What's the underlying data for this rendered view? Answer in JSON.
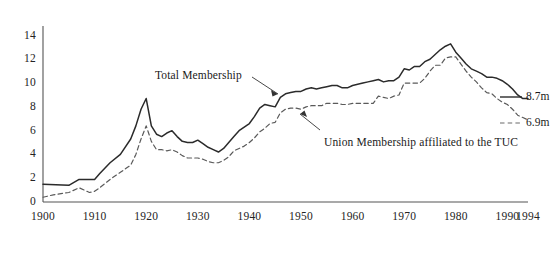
{
  "chart_data": {
    "type": "line",
    "title": "",
    "subtitle": "",
    "xlabel": "",
    "ylabel": "",
    "xlim": [
      1900,
      1994
    ],
    "ylim": [
      0,
      14.8
    ],
    "grid": false,
    "legend_position": "inline-annotations",
    "xticks": [
      "1900",
      "1910",
      "1920",
      "1930",
      "1940",
      "1950",
      "1960",
      "1970",
      "1980",
      "1990",
      "1994"
    ],
    "xtick_values": [
      1900,
      1910,
      1920,
      1930,
      1940,
      1950,
      1960,
      1970,
      1980,
      1990,
      1994
    ],
    "yticks": [
      "0",
      "2",
      "4",
      "6",
      "8",
      "10",
      "12",
      "14"
    ],
    "ytick_values": [
      0,
      2,
      4,
      6,
      8,
      10,
      12,
      14
    ],
    "annotations": [
      {
        "name": "total-membership",
        "text": "Total Membership",
        "x": 1941,
        "y": 11.4
      },
      {
        "name": "tuc-membership",
        "text": "Union Membership affiliated to the TUC",
        "x": 1948,
        "y": 5.1
      }
    ],
    "end_labels": [
      {
        "name": "total-membership-end",
        "text": "8.7m",
        "value": 8.7
      },
      {
        "name": "tuc-membership-end",
        "text": "6.9m",
        "value": 6.9
      }
    ],
    "series": [
      {
        "name": "Total Membership",
        "style": "solid",
        "color": "#2b2b2b",
        "x": [
          1900,
          1905,
          1907,
          1910,
          1911,
          1913,
          1915,
          1917,
          1918,
          1919,
          1920,
          1921,
          1922,
          1923,
          1924,
          1925,
          1926,
          1927,
          1928,
          1929,
          1930,
          1931,
          1932,
          1933,
          1934,
          1935,
          1936,
          1937,
          1938,
          1939,
          1940,
          1941,
          1942,
          1943,
          1944,
          1945,
          1946,
          1947,
          1948,
          1949,
          1950,
          1951,
          1952,
          1953,
          1954,
          1955,
          1956,
          1957,
          1958,
          1959,
          1960,
          1961,
          1962,
          1963,
          1964,
          1965,
          1966,
          1967,
          1968,
          1969,
          1970,
          1971,
          1972,
          1973,
          1974,
          1975,
          1976,
          1977,
          1978,
          1979,
          1980,
          1981,
          1982,
          1983,
          1984,
          1985,
          1986,
          1987,
          1988,
          1989,
          1990,
          1991,
          1992,
          1993,
          1994
        ],
        "y": [
          1.5,
          1.4,
          1.9,
          1.9,
          2.4,
          3.3,
          4.0,
          5.3,
          6.4,
          7.8,
          8.7,
          6.4,
          5.7,
          5.5,
          5.8,
          6.0,
          5.5,
          5.1,
          5.0,
          5.0,
          5.2,
          4.9,
          4.6,
          4.4,
          4.2,
          4.5,
          5.0,
          5.5,
          6.0,
          6.3,
          6.6,
          7.2,
          7.9,
          8.2,
          8.1,
          8.0,
          8.8,
          9.1,
          9.2,
          9.3,
          9.3,
          9.5,
          9.6,
          9.5,
          9.6,
          9.7,
          9.8,
          9.8,
          9.6,
          9.6,
          9.8,
          9.9,
          10.0,
          10.1,
          10.2,
          10.3,
          10.1,
          10.2,
          10.2,
          10.5,
          11.2,
          11.1,
          11.4,
          11.4,
          11.8,
          12.0,
          12.4,
          12.8,
          13.1,
          13.3,
          12.6,
          12.1,
          11.6,
          11.2,
          11.0,
          10.8,
          10.5,
          10.5,
          10.4,
          10.2,
          9.9,
          9.5,
          9.0,
          8.7,
          8.7
        ]
      },
      {
        "name": "Union Membership affiliated to the TUC",
        "style": "dashed",
        "color": "#5a5a5a",
        "x": [
          1900,
          1902,
          1905,
          1907,
          1909,
          1910,
          1911,
          1913,
          1915,
          1917,
          1918,
          1919,
          1920,
          1921,
          1922,
          1923,
          1924,
          1925,
          1926,
          1927,
          1928,
          1929,
          1930,
          1931,
          1932,
          1933,
          1934,
          1935,
          1936,
          1937,
          1938,
          1939,
          1940,
          1941,
          1942,
          1943,
          1944,
          1945,
          1946,
          1947,
          1948,
          1949,
          1950,
          1951,
          1952,
          1953,
          1954,
          1955,
          1956,
          1957,
          1958,
          1959,
          1960,
          1961,
          1962,
          1963,
          1964,
          1965,
          1966,
          1967,
          1968,
          1969,
          1970,
          1971,
          1972,
          1973,
          1974,
          1975,
          1976,
          1977,
          1978,
          1979,
          1980,
          1981,
          1982,
          1983,
          1984,
          1985,
          1986,
          1987,
          1988,
          1989,
          1990,
          1991,
          1992,
          1993,
          1994
        ],
        "y": [
          0.4,
          0.6,
          0.8,
          1.2,
          0.8,
          0.9,
          1.2,
          1.9,
          2.5,
          3.1,
          4.0,
          5.3,
          6.4,
          5.1,
          4.4,
          4.4,
          4.3,
          4.4,
          4.2,
          3.9,
          3.7,
          3.7,
          3.7,
          3.6,
          3.4,
          3.3,
          3.3,
          3.5,
          3.8,
          4.3,
          4.5,
          4.7,
          5.0,
          5.4,
          5.9,
          6.2,
          6.6,
          6.7,
          7.5,
          7.8,
          7.9,
          7.9,
          7.8,
          8.0,
          8.1,
          8.1,
          8.1,
          8.3,
          8.3,
          8.3,
          8.2,
          8.2,
          8.3,
          8.3,
          8.3,
          8.3,
          8.3,
          8.9,
          8.8,
          8.7,
          8.9,
          9.0,
          10.0,
          10.0,
          10.0,
          10.0,
          10.4,
          11.0,
          11.5,
          11.5,
          12.1,
          12.2,
          12.2,
          11.6,
          11.0,
          10.5,
          10.1,
          9.6,
          9.2,
          9.1,
          8.7,
          8.4,
          8.2,
          7.8,
          7.3,
          7.1,
          6.9
        ]
      }
    ]
  },
  "axis": {
    "y_axis_name": "membership-millions-axis",
    "x_axis_name": "year-axis"
  }
}
